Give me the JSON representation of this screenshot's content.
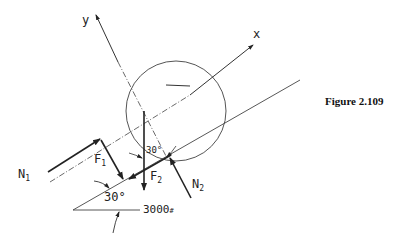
{
  "figure": {
    "caption": "Figure 2.109",
    "axes": {
      "x_label": "x",
      "y_label": "y"
    },
    "labels": {
      "n1": "N",
      "n1_sub": "1",
      "n2": "N",
      "n2_sub": "2",
      "f1": "F",
      "f1_sub": "1",
      "f2": "F",
      "f2_sub": "2",
      "angle_incline": "30°",
      "angle_center": "30°",
      "weight": "3000",
      "weight_unit": "#"
    },
    "colors": {
      "line": "#333333",
      "text": "#222222"
    }
  }
}
